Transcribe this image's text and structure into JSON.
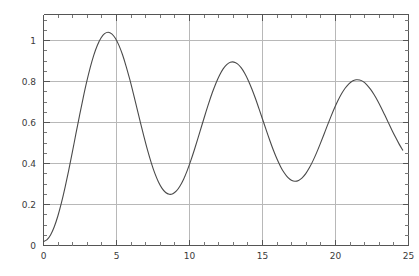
{
  "chart_data": {
    "type": "line",
    "title": "",
    "subtitle": "",
    "xlabel": "",
    "ylabel": "",
    "xlim": [
      0,
      25.4
    ],
    "ylim": [
      -0.02,
      1.14
    ],
    "grid": true,
    "legend": null,
    "frame": true,
    "x_ticks_major": [
      0,
      5,
      10,
      15,
      20,
      25
    ],
    "x_tick_labels": [
      "0",
      "5",
      "10",
      "15",
      "20",
      "25"
    ],
    "x_ticks_minor": [
      1,
      2,
      3,
      4,
      6,
      7,
      8,
      9,
      11,
      12,
      13,
      14,
      16,
      17,
      18,
      19,
      21,
      22,
      23,
      24
    ],
    "y_ticks_major": [
      0,
      0.2,
      0.4,
      0.6,
      0.8,
      1
    ],
    "y_tick_labels": [
      "0",
      "0.2",
      "0.4",
      "0.6",
      "0.8",
      "1"
    ],
    "y_ticks_minor": [
      0.05,
      0.1,
      0.15,
      0.25,
      0.3,
      0.35,
      0.45,
      0.5,
      0.55,
      0.65,
      0.7,
      0.75,
      0.85,
      0.9,
      0.95,
      1.05,
      1.1
    ],
    "series": [
      {
        "name": "damped-oscillation",
        "color": "#4a4a4a",
        "peaks": [
          {
            "x": 3.6,
            "y": 1.095
          },
          {
            "x": 10.1,
            "y": 0.89
          },
          {
            "x": 16.5,
            "y": 0.83
          },
          {
            "x": 22.8,
            "y": 0.8
          }
        ],
        "troughs": [
          {
            "x": 6.9,
            "y": 0.345
          },
          {
            "x": 13.3,
            "y": 0.42
          },
          {
            "x": 19.7,
            "y": 0.455
          }
        ],
        "endpoints": [
          {
            "x": 0.0,
            "y": 0.0
          },
          {
            "x": 25.0,
            "y": 0.53
          }
        ],
        "x": [
          0,
          0.25,
          0.5,
          0.75,
          1,
          1.25,
          1.5,
          1.75,
          2,
          2.25,
          2.5,
          2.75,
          3,
          3.25,
          3.5,
          3.75,
          4,
          4.25,
          4.5,
          4.75,
          5,
          5.25,
          5.5,
          5.75,
          6,
          6.25,
          6.5,
          6.75,
          7,
          7.25,
          7.5,
          7.75,
          8,
          8.25,
          8.5,
          8.75,
          9,
          9.25,
          9.5,
          9.75,
          10,
          10.25,
          10.5,
          10.75,
          11,
          11.25,
          11.5,
          11.75,
          12,
          12.25,
          12.5,
          12.75,
          13,
          13.25,
          13.5,
          13.75,
          14,
          14.25,
          14.5,
          14.75,
          15,
          15.25,
          15.5,
          15.75,
          16,
          16.25,
          16.5,
          16.75,
          17,
          17.25,
          17.5,
          17.75,
          18,
          18.25,
          18.5,
          18.75,
          19,
          19.25,
          19.5,
          19.75,
          20,
          20.25,
          20.5,
          20.75,
          21,
          21.25,
          21.5,
          21.75,
          22,
          22.25,
          22.5,
          22.75,
          23,
          23.25,
          23.5,
          23.75,
          24,
          24.25,
          24.5,
          24.75,
          25
        ],
        "y": [
          0.0,
          0.009,
          0.034,
          0.074,
          0.128,
          0.195,
          0.272,
          0.356,
          0.446,
          0.539,
          0.63,
          0.718,
          0.8,
          0.873,
          0.936,
          0.986,
          1.022,
          1.044,
          1.051,
          1.043,
          1.021,
          0.985,
          0.938,
          0.88,
          0.815,
          0.744,
          0.67,
          0.596,
          0.524,
          0.456,
          0.395,
          0.342,
          0.299,
          0.267,
          0.246,
          0.237,
          0.24,
          0.254,
          0.279,
          0.313,
          0.356,
          0.406,
          0.461,
          0.519,
          0.579,
          0.638,
          0.695,
          0.748,
          0.795,
          0.835,
          0.867,
          0.888,
          0.9,
          0.901,
          0.892,
          0.873,
          0.845,
          0.809,
          0.766,
          0.718,
          0.666,
          0.613,
          0.559,
          0.507,
          0.458,
          0.414,
          0.376,
          0.345,
          0.322,
          0.308,
          0.303,
          0.307,
          0.32,
          0.341,
          0.37,
          0.405,
          0.445,
          0.489,
          0.535,
          0.582,
          0.627,
          0.67,
          0.709,
          0.743,
          0.771,
          0.792,
          0.806,
          0.812,
          0.811,
          0.803,
          0.787,
          0.765,
          0.738,
          0.707,
          0.672,
          0.635,
          0.597,
          0.559,
          0.523,
          0.489,
          0.459
        ]
      }
    ]
  },
  "plot": {
    "background_color": "#ffffff",
    "curve_color": "#4a4a4a",
    "grid_color": "#b8b8b8",
    "axis_color": "#555555",
    "label_color": "#3a3a3a"
  }
}
